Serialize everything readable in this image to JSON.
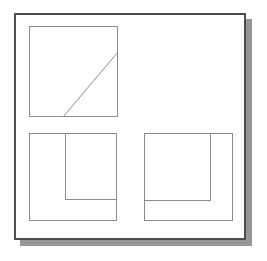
{
  "document": {
    "title": "Geometric line drawing",
    "description": "A white page with a dark outer border and drop shadow containing three thin-lined geometric figures: a square crossed by a diagonal, and two nested square pairs.",
    "canvas": {
      "width": 267,
      "height": 261,
      "background": "#ffffff"
    }
  },
  "colors": {
    "page_background": "#ffffff",
    "frame_border": "#4d4d4d",
    "shape_stroke": "#8c8c8c",
    "drop_shadow": "#969696"
  },
  "frame": {
    "label": "outer-frame",
    "x": 14,
    "y": 13,
    "width": 232,
    "height": 227,
    "border_width": 2,
    "fill": "#ffffff"
  },
  "shadow": {
    "label": "drop-shadow",
    "offset_x": 6,
    "offset_y": 6,
    "color": "#969696"
  },
  "shapes": [
    {
      "id": "top-left-square",
      "name": "square-with-diagonal",
      "x": 29,
      "y": 26,
      "width": 89,
      "height": 91,
      "stroke": "#8c8c8c",
      "stroke_width": 1
    },
    {
      "id": "diagonal",
      "name": "diagonal-line",
      "x1": 63,
      "y1": 117,
      "x2": 118,
      "y2": 52,
      "stroke": "#8c8c8c",
      "stroke_width": 1
    },
    {
      "id": "bottom-left-outer",
      "name": "bottom-left-outer-square",
      "x": 29,
      "y": 133,
      "width": 88,
      "height": 88,
      "stroke": "#8c8c8c",
      "stroke_width": 1
    },
    {
      "id": "bottom-left-inner",
      "name": "bottom-left-inner-rectangle",
      "x": 65,
      "y": 133,
      "width": 52,
      "height": 67,
      "stroke": "#8c8c8c",
      "stroke_width": 1,
      "open_side": "top"
    },
    {
      "id": "bottom-right-outer",
      "name": "bottom-right-outer-square",
      "x": 144,
      "y": 133,
      "width": 89,
      "height": 88,
      "stroke": "#8c8c8c",
      "stroke_width": 1
    },
    {
      "id": "bottom-right-inner",
      "name": "bottom-right-inner-rectangle",
      "x": 144,
      "y": 133,
      "width": 67,
      "height": 68,
      "stroke": "#8c8c8c",
      "stroke_width": 1,
      "open_side": "top-left"
    }
  ]
}
